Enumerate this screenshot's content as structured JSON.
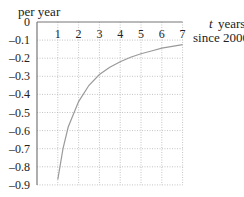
{
  "chart_data": {
    "type": "line",
    "title": "",
    "ylabel": "per year",
    "xlabel_var": "t",
    "xlabel_line1": "years",
    "xlabel_line2": "since 2000",
    "x_ticks": [
      "1",
      "2",
      "3",
      "4",
      "5",
      "6",
      "7"
    ],
    "y_ticks": [
      "0",
      "–0.1",
      "–0.2",
      "–0.3",
      "–0.4",
      "–0.5",
      "–0.6",
      "–0.7",
      "–0.8",
      "–0.9"
    ],
    "xlim": [
      0,
      7
    ],
    "ylim": [
      -0.9,
      0
    ],
    "grid": true,
    "grid_style": "dotted",
    "series": [
      {
        "name": "rate",
        "color": "#9a9a9a",
        "x": [
          1.0,
          1.25,
          1.5,
          2,
          2.5,
          3,
          3.5,
          4,
          4.5,
          5,
          5.5,
          6,
          6.5,
          7
        ],
        "y": [
          -0.87,
          -0.7,
          -0.58,
          -0.44,
          -0.35,
          -0.29,
          -0.25,
          -0.22,
          -0.195,
          -0.175,
          -0.16,
          -0.145,
          -0.135,
          -0.125
        ]
      }
    ]
  }
}
